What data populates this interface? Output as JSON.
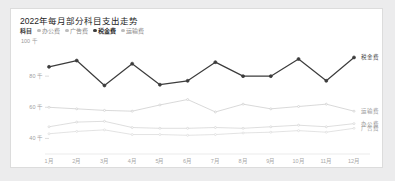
{
  "card": {
    "title": "2022年每月部分科目支出走势",
    "unit_label": "100 千"
  },
  "legend": {
    "group_label": "科目",
    "items": [
      {
        "label": "办公费",
        "active": false
      },
      {
        "label": "广告费",
        "active": false
      },
      {
        "label": "税金费",
        "active": true
      },
      {
        "label": "运输费",
        "active": false
      }
    ]
  },
  "chart_data": {
    "type": "line",
    "title": "2022年每月部分科目支出走势",
    "xlabel": "",
    "ylabel": "",
    "unit": "千",
    "grid": false,
    "legend_position": "top-left",
    "categories": [
      "1月",
      "2月",
      "3月",
      "4月",
      "5月",
      "6月",
      "7月",
      "8月",
      "9月",
      "10月",
      "11月",
      "12月"
    ],
    "ylim": [
      30000,
      100000
    ],
    "yticks": [
      100000,
      80000,
      60000,
      40000
    ],
    "ytick_labels": [
      "100 千",
      "80 千",
      "60 千",
      "40 千"
    ],
    "series": [
      {
        "name": "税金费",
        "color": "#3c3c3c",
        "emphasis": true,
        "end_label": "税金费",
        "values": [
          86000,
          90000,
          74000,
          88000,
          74500,
          77000,
          89000,
          80000,
          80000,
          91000,
          77000,
          92000
        ]
      },
      {
        "name": "运输费",
        "color": "#cfcfcf",
        "emphasis": false,
        "end_label": "运输费",
        "values": [
          60000,
          59000,
          58000,
          57500,
          61500,
          65000,
          57000,
          62000,
          59000,
          60500,
          62000,
          57500
        ]
      },
      {
        "name": "办公费",
        "color": "#d6d6d6",
        "emphasis": false,
        "end_label": "办公费",
        "values": [
          47500,
          50500,
          51000,
          47000,
          46500,
          46500,
          47000,
          46500,
          47500,
          48500,
          47500,
          49500
        ]
      },
      {
        "name": "广告费",
        "color": "#dcdcdc",
        "emphasis": false,
        "end_label": "广告费",
        "values": [
          43000,
          44500,
          45500,
          42500,
          42500,
          42000,
          42500,
          43500,
          44000,
          45000,
          44000,
          46500
        ]
      }
    ]
  }
}
